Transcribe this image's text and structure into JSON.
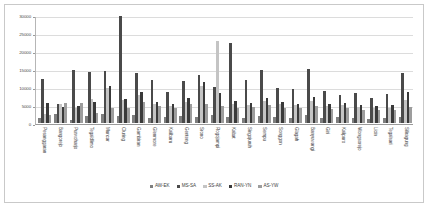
{
  "chart_data": {
    "type": "bar",
    "title": "",
    "xlabel": "",
    "ylabel": "",
    "ylim": [
      0,
      30000
    ],
    "yticks": [
      0,
      5000,
      10000,
      15000,
      20000,
      25000,
      30000
    ],
    "grid": true,
    "legend_position": "bottom",
    "categories": [
      "Pesanggaran",
      "Bangorejo",
      "Purwoharjo",
      "Tegaldlimo",
      "Muncar",
      "Cluring",
      "Gambiran",
      "Glenmore",
      "Kalibaru",
      "Genteng",
      "Srono",
      "Rogojampi",
      "Kabat",
      "Singojuruh",
      "Sempu",
      "Songgon",
      "Glagah",
      "Banyuwangi",
      "Giri",
      "Kalipuro",
      "Wongsorejo",
      "Licin",
      "Tegalsari",
      "Siliragung"
    ],
    "series": [
      {
        "name": "AW-EK",
        "color": "#7f7f7f",
        "values": [
          1400,
          2600,
          900,
          2000,
          2500,
          1900,
          2100,
          1500,
          1800,
          2000,
          1700,
          2200,
          1600,
          1500,
          1900,
          1700,
          1500,
          2100,
          1400,
          1700,
          1300,
          1100,
          1500,
          1800
        ]
      },
      {
        "name": "MS-SA",
        "color": "#4a4a4a",
        "values": [
          12200,
          5300,
          14700,
          14100,
          14400,
          29800,
          14000,
          11900,
          8500,
          11600,
          13400,
          9900,
          22200,
          12000,
          14800,
          9700,
          9500,
          14900,
          8900,
          7900,
          8300,
          6900,
          8000,
          13900
        ]
      },
      {
        "name": "SS-AK",
        "color": "#c4c4c4",
        "values": [
          2500,
          5200,
          4200,
          6600,
          9600,
          6500,
          7800,
          5400,
          4600,
          5900,
          10200,
          22700,
          5200,
          5000,
          6100,
          5400,
          5100,
          6200,
          4800,
          5000,
          4400,
          4200,
          4300,
          6300
        ]
      },
      {
        "name": "RAN-YN",
        "color": "#3a3a3a",
        "values": [
          5500,
          4500,
          4700,
          5800,
          10300,
          6800,
          8700,
          5800,
          5400,
          7000,
          11300,
          8200,
          6100,
          5600,
          6900,
          5800,
          5400,
          7100,
          5200,
          5600,
          5000,
          4700,
          4900,
          8600
        ]
      },
      {
        "name": "AS-YW",
        "color": "#9d9d9d",
        "values": [
          2200,
          5600,
          5600,
          2900,
          4300,
          4100,
          5800,
          4700,
          4200,
          5200,
          5400,
          4600,
          4200,
          4400,
          5000,
          4300,
          4200,
          4600,
          4000,
          4100,
          3700,
          3500,
          3600,
          4500
        ]
      }
    ]
  }
}
